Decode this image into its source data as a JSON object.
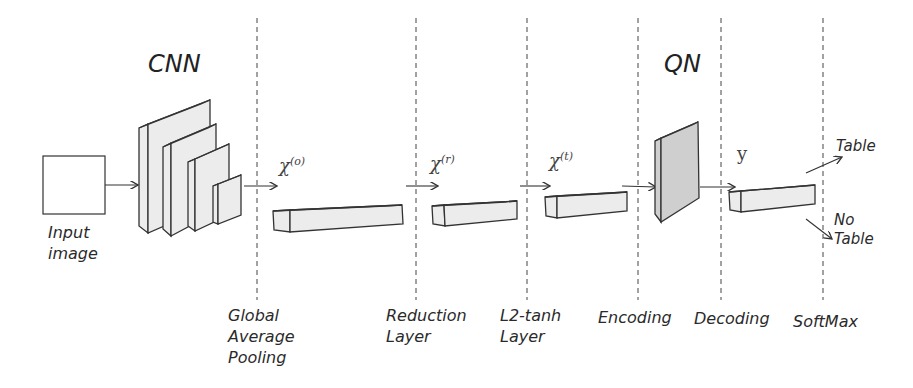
{
  "titles": {
    "cnn": "CNN",
    "qn": "QN"
  },
  "input": {
    "label": "Input\nimage"
  },
  "variables": {
    "x0": {
      "base": "χ",
      "sup": "(o)"
    },
    "xr": {
      "base": "χ",
      "sup": "(r)"
    },
    "xt": {
      "base": "χ",
      "sup": "(t)"
    },
    "y": "y"
  },
  "outputs": {
    "table": "Table",
    "no_table": "No\nTable"
  },
  "stages": [
    {
      "label": "Global\nAverage\nPooling"
    },
    {
      "label": "Reduction\nLayer"
    },
    {
      "label": "L2-tanh\nLayer"
    },
    {
      "label": "Encoding"
    },
    {
      "label": "Decoding"
    },
    {
      "label": "SoftMax"
    }
  ],
  "colors": {
    "block_fill": "#ececec",
    "qn_fill": "#cfcfcf",
    "stroke": "#333333",
    "divider": "#444444"
  }
}
